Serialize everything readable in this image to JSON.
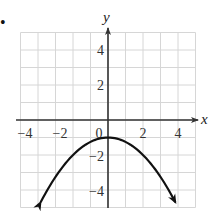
{
  "chart_data": {
    "type": "line",
    "title": "",
    "xlabel": "x",
    "ylabel": "y",
    "xlim": [
      -5,
      5
    ],
    "ylim": [
      -5,
      5
    ],
    "grid": true,
    "x_ticks": [
      -4,
      -2,
      0,
      2,
      4
    ],
    "x_tick_labels": [
      "−4",
      "−2",
      "0",
      "2",
      "4"
    ],
    "y_ticks": [
      4,
      2,
      -2,
      -4
    ],
    "y_tick_labels": [
      "4",
      "2",
      "−2",
      "−4"
    ],
    "series": [
      {
        "name": "parabola",
        "equation": "y = -x^2/4 - 1",
        "vertex": [
          0,
          -1
        ],
        "x": [
          -3.9,
          -3,
          -2,
          -1,
          0,
          1,
          2,
          3,
          3.9
        ],
        "y": [
          -4.8,
          -3.25,
          -2,
          -1.25,
          -1,
          -1.25,
          -2,
          -3.25,
          -4.8
        ],
        "arrows_both_ends": true
      }
    ],
    "legend": null
  },
  "bullet": "•",
  "colors": {
    "grid": "#d6d6d6",
    "axis": "#333333",
    "curve": "#111111"
  }
}
